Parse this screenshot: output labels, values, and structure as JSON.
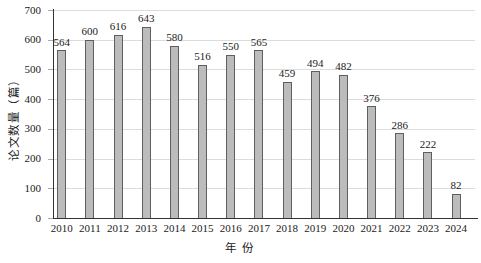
{
  "chart_data": {
    "type": "bar",
    "title": "",
    "categories": [
      "2010",
      "2011",
      "2012",
      "2013",
      "2014",
      "2015",
      "2016",
      "2017",
      "2018",
      "2019",
      "2020",
      "2021",
      "2022",
      "2023",
      "2024"
    ],
    "values": [
      564,
      600,
      616,
      643,
      580,
      516,
      550,
      565,
      459,
      494,
      482,
      376,
      286,
      222,
      82
    ],
    "xlabel": "年 份",
    "ylabel": "论文数量（篇）",
    "ylim": [
      0,
      700
    ],
    "yticks": [
      0,
      100,
      200,
      300,
      400,
      500,
      600,
      700
    ],
    "grid": "horizontal",
    "legend": "none",
    "bar_labels_shown": true,
    "colors": {
      "bar_fill": "#bcbcbc",
      "bar_border": "#5f5f5f",
      "gridline": "#dcdcdc",
      "axis": "#333333",
      "tick_stub": "#ababab",
      "text": "#1b1b1b",
      "background": "#ffffff"
    }
  }
}
